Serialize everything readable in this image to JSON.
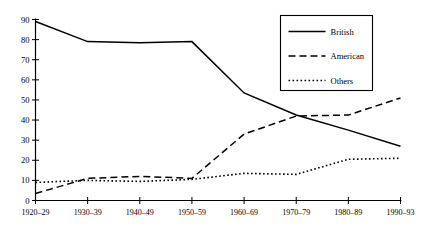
{
  "chart_data": {
    "type": "line",
    "title": "",
    "subtitle": "",
    "xlabel": "",
    "ylabel": "",
    "categories": [
      "1920–29",
      "1930–39",
      "1940–49",
      "1950–59",
      "1960–69",
      "1970–79",
      "1980–89",
      "1990–93"
    ],
    "ylim": [
      0,
      90
    ],
    "xlim": [
      0,
      7
    ],
    "yticks": [
      0,
      10,
      20,
      30,
      40,
      50,
      60,
      70,
      80,
      90
    ],
    "ytick_labels": [
      "0",
      "10",
      "20",
      "30",
      "40",
      "50",
      "60",
      "70",
      "80",
      "90"
    ],
    "grid": false,
    "legend_position": "top-right",
    "series": [
      {
        "name": "British",
        "style": "solid",
        "color": "#000000",
        "values": [
          89,
          79,
          78.5,
          79,
          53.5,
          42.5,
          35,
          27
        ]
      },
      {
        "name": "American",
        "style": "dashed",
        "color": "#000000",
        "values": [
          3.5,
          11,
          12,
          11,
          33,
          42,
          42.5,
          51
        ]
      },
      {
        "name": "Others",
        "style": "dotted",
        "color": "#000000",
        "values": [
          9,
          10,
          9.5,
          10.5,
          13.5,
          13,
          20.5,
          21
        ]
      }
    ]
  },
  "legend": {
    "entries": [
      {
        "label": "British"
      },
      {
        "label": "American"
      },
      {
        "label": "Others"
      }
    ]
  }
}
